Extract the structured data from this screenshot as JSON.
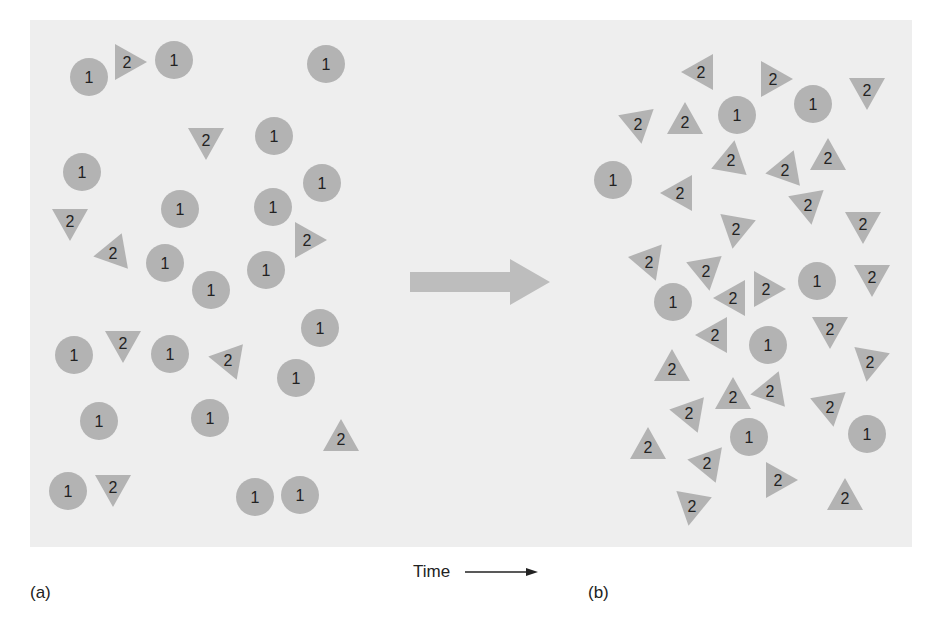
{
  "figure": {
    "panel_a_label": "(a)",
    "panel_b_label": "(b)",
    "time_axis_label": "Time",
    "colors": {
      "background": "#ffffff",
      "panel_fill": "#eeeeee",
      "particle_fill": "#b3b3b3",
      "arrow_fill": "#bdbdbd",
      "text": "#222222"
    }
  },
  "panel_a": {
    "species_1": {
      "label": "1",
      "shape": "circle",
      "positions": [
        [
          89,
          77
        ],
        [
          174,
          60
        ],
        [
          326,
          64
        ],
        [
          82,
          172
        ],
        [
          274,
          136
        ],
        [
          322,
          183
        ],
        [
          180,
          209
        ],
        [
          273,
          207
        ],
        [
          165,
          263
        ],
        [
          211,
          290
        ],
        [
          266,
          270
        ],
        [
          320,
          328
        ],
        [
          74,
          355
        ],
        [
          170,
          354
        ],
        [
          296,
          378
        ],
        [
          99,
          421
        ],
        [
          210,
          418
        ],
        [
          68,
          491
        ],
        [
          255,
          497
        ],
        [
          300,
          495
        ]
      ]
    },
    "species_2": {
      "label": "2",
      "shape": "triangle",
      "items": [
        {
          "x": 127,
          "y": 62,
          "rot": 90
        },
        {
          "x": 206,
          "y": 140,
          "rot": 180
        },
        {
          "x": 70,
          "y": 221,
          "rot": 180
        },
        {
          "x": 113,
          "y": 253,
          "rot": -100
        },
        {
          "x": 307,
          "y": 240,
          "rot": 90
        },
        {
          "x": 123,
          "y": 343,
          "rot": 180
        },
        {
          "x": 228,
          "y": 360,
          "rot": -80
        },
        {
          "x": 341,
          "y": 439,
          "rot": 0
        },
        {
          "x": 113,
          "y": 487,
          "rot": 180
        }
      ]
    }
  },
  "panel_b": {
    "species_1": {
      "label": "1",
      "shape": "circle",
      "positions": [
        [
          737,
          115
        ],
        [
          813,
          104
        ],
        [
          613,
          180
        ],
        [
          673,
          302
        ],
        [
          817,
          281
        ],
        [
          768,
          345
        ],
        [
          749,
          437
        ],
        [
          867,
          434
        ]
      ]
    },
    "species_2": {
      "label": "2",
      "shape": "triangle",
      "items": [
        {
          "x": 701,
          "y": 72,
          "rot": -90
        },
        {
          "x": 773,
          "y": 79,
          "rot": 90
        },
        {
          "x": 867,
          "y": 90,
          "rot": 180
        },
        {
          "x": 638,
          "y": 124,
          "rot": 170
        },
        {
          "x": 685,
          "y": 122,
          "rot": 0
        },
        {
          "x": 731,
          "y": 160,
          "rot": 10
        },
        {
          "x": 785,
          "y": 170,
          "rot": -100
        },
        {
          "x": 828,
          "y": 158,
          "rot": 0
        },
        {
          "x": 680,
          "y": 193,
          "rot": -90
        },
        {
          "x": 808,
          "y": 205,
          "rot": 170
        },
        {
          "x": 863,
          "y": 224,
          "rot": 180
        },
        {
          "x": 736,
          "y": 229,
          "rot": 190
        },
        {
          "x": 649,
          "y": 262,
          "rot": 160
        },
        {
          "x": 706,
          "y": 271,
          "rot": 170
        },
        {
          "x": 733,
          "y": 298,
          "rot": -90
        },
        {
          "x": 766,
          "y": 289,
          "rot": 90
        },
        {
          "x": 872,
          "y": 277,
          "rot": 180
        },
        {
          "x": 715,
          "y": 335,
          "rot": -90
        },
        {
          "x": 830,
          "y": 329,
          "rot": 180
        },
        {
          "x": 870,
          "y": 362,
          "rot": 190
        },
        {
          "x": 672,
          "y": 369,
          "rot": 0
        },
        {
          "x": 733,
          "y": 397,
          "rot": 0
        },
        {
          "x": 770,
          "y": 391,
          "rot": -100
        },
        {
          "x": 689,
          "y": 413,
          "rot": -80
        },
        {
          "x": 830,
          "y": 407,
          "rot": 170
        },
        {
          "x": 648,
          "y": 447,
          "rot": 0
        },
        {
          "x": 707,
          "y": 463,
          "rot": -80
        },
        {
          "x": 778,
          "y": 480,
          "rot": 90
        },
        {
          "x": 692,
          "y": 506,
          "rot": 190
        },
        {
          "x": 845,
          "y": 498,
          "rot": 0
        }
      ]
    }
  },
  "transition_arrow": {
    "x1": 410,
    "x2": 550,
    "y": 282
  }
}
